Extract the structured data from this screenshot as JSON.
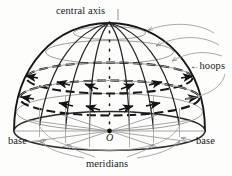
{
  "figure": {
    "background_color": "#fdfdfc",
    "ink_color": "#1a1a1a",
    "thin_line_color": "#8e8e8e",
    "leader_color": "#9a9a9a",
    "labels": {
      "central_axis": "central axis",
      "hoops": "hoops",
      "hoops_arrow": "←",
      "base_left": "base",
      "base_right": "base",
      "meridians": "meridians",
      "center_point": "O"
    },
    "parts": [
      {
        "name": "central-axis",
        "label": "central axis",
        "description": "vertical dotted axis from apex to center O"
      },
      {
        "name": "hoops",
        "label": "hoops",
        "description": "horizontal latitude circles, two drawn bold and dashed with arrows"
      },
      {
        "name": "base",
        "label": "base",
        "description": "bottom ellipse of the dome"
      },
      {
        "name": "meridians",
        "label": "meridians",
        "description": "vertical great-circle lines converging at the apex"
      },
      {
        "name": "center-point",
        "label": "O",
        "description": "center of the base ellipse"
      }
    ],
    "counts": {
      "meridians": 8,
      "hoops": 5,
      "bold_hoops": 2,
      "hoop_leader_arrows": 4,
      "meridian_leader_arrows": 4
    }
  }
}
